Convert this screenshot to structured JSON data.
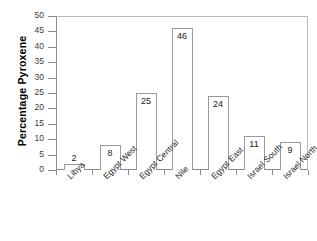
{
  "chart_data": {
    "type": "bar",
    "title": "",
    "xlabel": "",
    "ylabel": "Percentage  Pyroxene",
    "categories": [
      "Libya",
      "Egypt West",
      "Egypt Central",
      "Nile",
      "Egypt East",
      "Israel South",
      "Israel North"
    ],
    "values": [
      2,
      8,
      25,
      46,
      24,
      11,
      9
    ],
    "value_labels": [
      "2",
      "8",
      "25",
      "46",
      "24",
      "11",
      "9"
    ],
    "ylim": [
      0,
      50
    ],
    "ytick_step": 5,
    "ytick_labels": [
      "50",
      "45",
      "40",
      "35",
      "30",
      "25",
      "20",
      "15",
      "10",
      "5",
      "0"
    ],
    "grid": false,
    "legend": null,
    "bar_style": {
      "fill": "#ffffff",
      "edge": "#9a9a9a"
    },
    "axis_color": "#8c8c8c",
    "frame_color": "#b9b9b9",
    "xlabel_rotation_deg": -45
  }
}
